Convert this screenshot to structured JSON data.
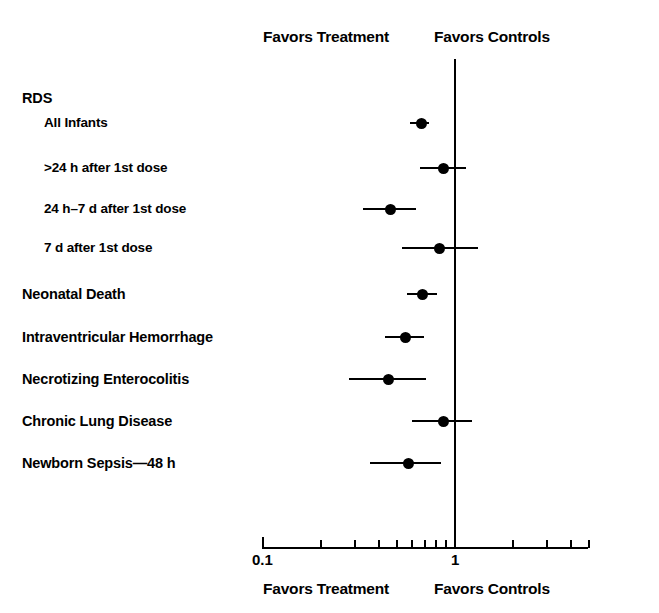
{
  "figure": {
    "header_left": "Favors Treatment",
    "header_right": "Favors Controls",
    "footer_left": "Favors Treatment",
    "footer_right": "Favors Controls"
  },
  "chart_data": {
    "type": "scatter",
    "subtype": "forest-plot",
    "title": "",
    "xlabel": "",
    "ylabel": "",
    "xscale": "log",
    "xlim": [
      0.1,
      5.5
    ],
    "grid": false,
    "null_value": 1,
    "annotations": {
      "left_of_null": "Favors Treatment",
      "right_of_null": "Favors Controls"
    },
    "axis_ticks": {
      "labeled": [
        {
          "value": 0.1,
          "label": "0.1"
        },
        {
          "value": 1,
          "label": "1"
        }
      ],
      "unlabeled": [
        0.2,
        0.3,
        0.4,
        0.5,
        0.6,
        0.7,
        0.8,
        0.9,
        2,
        3,
        4,
        5
      ]
    },
    "rows": [
      {
        "label": "RDS",
        "type": "group-heading",
        "indent": false,
        "estimate": null,
        "ci_low": null,
        "ci_high": null
      },
      {
        "label": "All Infants",
        "type": "data",
        "indent": true,
        "estimate": 0.67,
        "ci_low": 0.58,
        "ci_high": 0.73
      },
      {
        "label": ">24 h after 1st dose",
        "type": "data",
        "indent": true,
        "estimate": 0.87,
        "ci_low": 0.66,
        "ci_high": 1.14
      },
      {
        "label": "24 h–7 d after 1st dose",
        "type": "data",
        "indent": true,
        "estimate": 0.46,
        "ci_low": 0.33,
        "ci_high": 0.63
      },
      {
        "label": "7 d after 1st dose",
        "type": "data",
        "indent": true,
        "estimate": 0.83,
        "ci_low": 0.53,
        "ci_high": 1.31
      },
      {
        "label": "Neonatal Death",
        "type": "data",
        "indent": false,
        "estimate": 0.68,
        "ci_low": 0.56,
        "ci_high": 0.81
      },
      {
        "label": "Intraventricular Hemorrhage",
        "type": "data",
        "indent": false,
        "estimate": 0.55,
        "ci_low": 0.43,
        "ci_high": 0.69
      },
      {
        "label": "Necrotizing Enterocolitis",
        "type": "data",
        "indent": false,
        "estimate": 0.45,
        "ci_low": 0.28,
        "ci_high": 0.71
      },
      {
        "label": "Chronic Lung Disease",
        "type": "data",
        "indent": false,
        "estimate": 0.87,
        "ci_low": 0.6,
        "ci_high": 1.22
      },
      {
        "label": "Newborn Sepsis—48 h",
        "type": "data",
        "indent": false,
        "estimate": 0.57,
        "ci_low": 0.36,
        "ci_high": 0.85
      }
    ]
  },
  "layout": {
    "row_y": [
      98,
      123,
      168,
      209,
      248,
      294,
      337,
      379,
      421,
      463
    ],
    "label_x_normal": 22,
    "label_x_indent": 44
  }
}
